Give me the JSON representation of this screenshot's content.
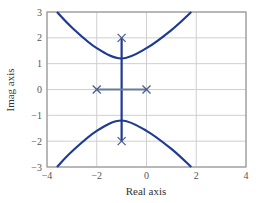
{
  "chart_data": {
    "type": "line",
    "title": "",
    "xlabel": "Real axis",
    "ylabel": "Imag axis",
    "xlim": [
      -4,
      4
    ],
    "ylim": [
      -3,
      3
    ],
    "grid": true,
    "x_ticks": [
      "-4",
      "-2",
      "0",
      "2",
      "4"
    ],
    "y_ticks": [
      "3",
      "2",
      "1",
      "0",
      "-1",
      "-2",
      "-3"
    ],
    "poles": [
      {
        "re": -2,
        "im": 0
      },
      {
        "re": 0,
        "im": 0
      },
      {
        "re": -1,
        "im": 2
      },
      {
        "re": -1,
        "im": -2
      }
    ],
    "series": [
      {
        "name": "upper-branch",
        "points": [
          [
            -3.6,
            3
          ],
          [
            -3,
            2.4
          ],
          [
            -2,
            1.6
          ],
          [
            -1,
            1.2
          ],
          [
            0,
            1.6
          ],
          [
            1,
            2.3
          ],
          [
            1.8,
            3
          ]
        ]
      },
      {
        "name": "lower-branch",
        "points": [
          [
            -3.6,
            -3
          ],
          [
            -3,
            -2.4
          ],
          [
            -2,
            -1.6
          ],
          [
            -1,
            -1.2
          ],
          [
            0,
            -1.6
          ],
          [
            1,
            -2.3
          ],
          [
            1.8,
            -3
          ]
        ]
      },
      {
        "name": "vertical-branch",
        "points": [
          [
            -1,
            2
          ],
          [
            -1,
            -2
          ]
        ]
      },
      {
        "name": "real-axis-branch",
        "points": [
          [
            -2,
            0
          ],
          [
            0,
            0
          ]
        ]
      }
    ],
    "colors": {
      "locus": "#1f3a93",
      "real_segment": "#6a7a9a",
      "pole_marker": "#4a5a8a",
      "grid": "#cfcfcf",
      "frame": "#888888"
    }
  }
}
